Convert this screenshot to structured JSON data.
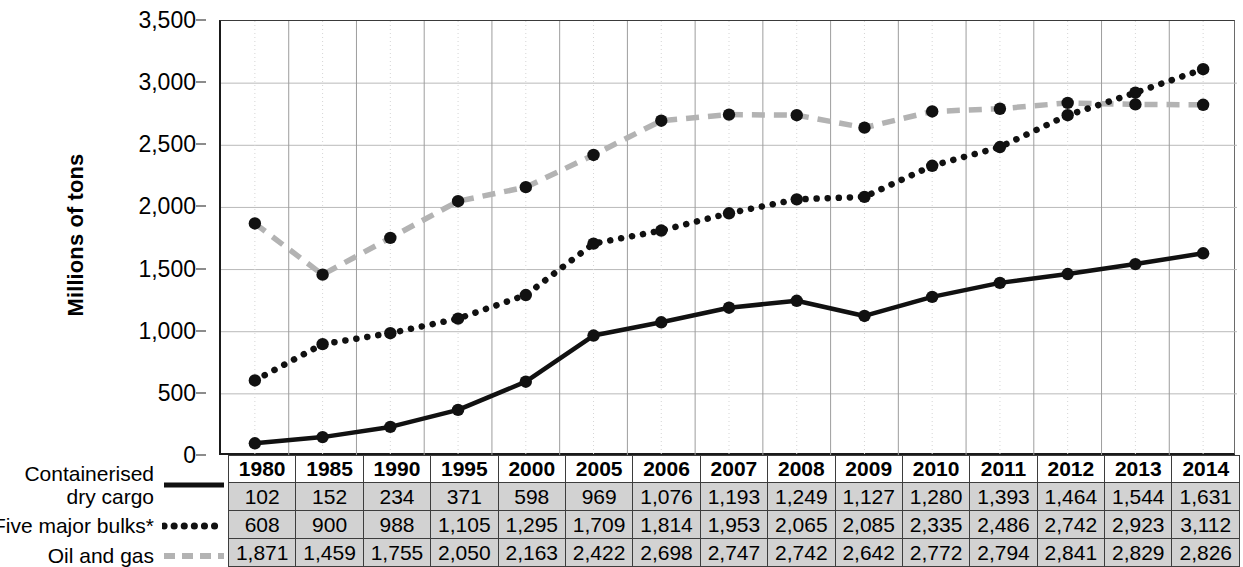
{
  "chart_data": {
    "type": "line",
    "title": "",
    "xlabel": "",
    "ylabel": "Millions of tons",
    "ylim": [
      0,
      3500
    ],
    "ytick_labels": [
      "0",
      "500",
      "1,000",
      "1,500",
      "2,000",
      "2,500",
      "3,000",
      "3,500"
    ],
    "ytick_values": [
      0,
      500,
      1000,
      1500,
      2000,
      2500,
      3000,
      3500
    ],
    "grid": true,
    "legend_position": "left",
    "categories": [
      "1980",
      "1985",
      "1990",
      "1995",
      "2000",
      "2005",
      "2006",
      "2007",
      "2008",
      "2009",
      "2010",
      "2011",
      "2012",
      "2013",
      "2014"
    ],
    "series": [
      {
        "name": "Containerised dry cargo",
        "style": "solid",
        "color": "#111111",
        "values": [
          102,
          152,
          234,
          371,
          598,
          969,
          1076,
          1193,
          1249,
          1127,
          1280,
          1393,
          1464,
          1544,
          1631
        ],
        "value_labels": [
          "102",
          "152",
          "234",
          "371",
          "598",
          "969",
          "1,076",
          "1,193",
          "1,249",
          "1,127",
          "1,280",
          "1,393",
          "1,464",
          "1,544",
          "1,631"
        ]
      },
      {
        "name": "Five major bulks*",
        "style": "dotted",
        "color": "#111111",
        "values": [
          608,
          900,
          988,
          1105,
          1295,
          1709,
          1814,
          1953,
          2065,
          2085,
          2335,
          2486,
          2742,
          2923,
          3112
        ],
        "value_labels": [
          "608",
          "900",
          "988",
          "1,105",
          "1,295",
          "1,709",
          "1,814",
          "1,953",
          "2,065",
          "2,085",
          "2,335",
          "2,486",
          "2,742",
          "2,923",
          "3,112"
        ]
      },
      {
        "name": "Oil and gas",
        "style": "dashed",
        "color": "#b3b3b3",
        "values": [
          1871,
          1459,
          1755,
          2050,
          2163,
          2422,
          2698,
          2747,
          2742,
          2642,
          2772,
          2794,
          2841,
          2829,
          2826
        ],
        "value_labels": [
          "1,871",
          "1,459",
          "1,755",
          "2,050",
          "2,163",
          "2,422",
          "2,698",
          "2,747",
          "2,742",
          "2,642",
          "2,772",
          "2,794",
          "2,841",
          "2,829",
          "2,826"
        ]
      }
    ]
  },
  "axis": {
    "y_title": "Millions of tons"
  },
  "legend": {
    "items": [
      {
        "line1": "Containerised",
        "line2": "dry cargo",
        "sample": "solid-line-sample"
      },
      {
        "line1": "",
        "line2": "Five major bulks*",
        "sample": "dotted-line-sample"
      },
      {
        "line1": "",
        "line2": "Oil and gas",
        "sample": "dashed-line-sample"
      }
    ]
  },
  "table": {
    "header": [
      "1980",
      "1985",
      "1990",
      "1995",
      "2000",
      "2005",
      "2006",
      "2007",
      "2008",
      "2009",
      "2010",
      "2011",
      "2012",
      "2013",
      "2014"
    ],
    "rows": [
      [
        "102",
        "152",
        "234",
        "371",
        "598",
        "969",
        "1,076",
        "1,193",
        "1,249",
        "1,127",
        "1,280",
        "1,393",
        "1,464",
        "1,544",
        "1,631"
      ],
      [
        "608",
        "900",
        "988",
        "1,105",
        "1,295",
        "1,709",
        "1,814",
        "1,953",
        "2,065",
        "2,085",
        "2,335",
        "2,486",
        "2,742",
        "2,923",
        "3,112"
      ],
      [
        "1,871",
        "1,459",
        "1,755",
        "2,050",
        "2,163",
        "2,422",
        "2,698",
        "2,747",
        "2,742",
        "2,642",
        "2,772",
        "2,794",
        "2,841",
        "2,829",
        "2,826"
      ]
    ]
  }
}
